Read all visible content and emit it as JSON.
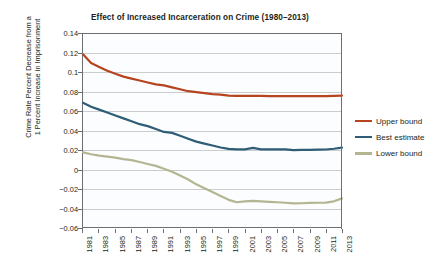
{
  "chart_data": {
    "type": "line",
    "title": "Effect of Increased Incarceration on Crime (1980–2013)",
    "xlabel": "",
    "ylabel": "Crime Rate Percent Decrease from a 1 Percent Increase in Imprisonment",
    "ylabel_lines": [
      "Crime Rate Percent Decrease from a",
      "1 Percent Increase in Imprisonment"
    ],
    "grid": true,
    "legend_position": "right",
    "xlim": [
      1981,
      2013
    ],
    "ylim": [
      -0.06,
      0.14
    ],
    "ytick_labels": [
      "0.14",
      "0.12",
      "0.1",
      "0.08",
      "0.06",
      "0.04",
      "0.02",
      "0",
      "−0.02",
      "−0.04",
      "−0.06"
    ],
    "yticks": [
      0.14,
      0.12,
      0.1,
      0.08,
      0.06,
      0.04,
      0.02,
      0,
      -0.02,
      -0.04,
      -0.06
    ],
    "xtick_labels": [
      "1981",
      "1983",
      "1985",
      "1987",
      "1989",
      "1991",
      "1993",
      "1995",
      "1997",
      "1999",
      "2001",
      "2003",
      "2005",
      "2007",
      "2009",
      "2011",
      "2013"
    ],
    "xticks": [
      1981,
      1983,
      1985,
      1987,
      1989,
      1991,
      1993,
      1995,
      1997,
      1999,
      2001,
      2003,
      2005,
      2007,
      2009,
      2011,
      2013
    ],
    "x": [
      1981,
      1982,
      1983,
      1984,
      1985,
      1986,
      1987,
      1988,
      1989,
      1990,
      1991,
      1992,
      1993,
      1994,
      1995,
      1996,
      1997,
      1998,
      1999,
      2000,
      2001,
      2002,
      2003,
      2004,
      2005,
      2006,
      2007,
      2008,
      2009,
      2010,
      2011,
      2012,
      2013
    ],
    "series": [
      {
        "name": "Upper bound",
        "color": "#b5441f",
        "values": [
          0.118,
          0.109,
          0.105,
          0.101,
          0.098,
          0.095,
          0.093,
          0.091,
          0.089,
          0.087,
          0.086,
          0.084,
          0.082,
          0.08,
          0.079,
          0.078,
          0.077,
          0.0765,
          0.0755,
          0.0752,
          0.0751,
          0.0751,
          0.0751,
          0.075,
          0.075,
          0.075,
          0.0749,
          0.0749,
          0.075,
          0.075,
          0.075,
          0.0752,
          0.0755
        ]
      },
      {
        "name": "Best estimate",
        "color": "#2f5d76",
        "values": [
          0.068,
          0.064,
          0.061,
          0.058,
          0.055,
          0.052,
          0.049,
          0.046,
          0.044,
          0.041,
          0.038,
          0.037,
          0.034,
          0.031,
          0.028,
          0.026,
          0.024,
          0.022,
          0.0205,
          0.02,
          0.02,
          0.0215,
          0.02,
          0.02,
          0.02,
          0.02,
          0.0193,
          0.0195,
          0.0196,
          0.0197,
          0.0199,
          0.0207,
          0.0218
        ]
      },
      {
        "name": "Lower bound",
        "color": "#b4b692",
        "values": [
          0.017,
          0.015,
          0.0135,
          0.0125,
          0.0115,
          0.01,
          0.009,
          0.007,
          0.005,
          0.003,
          0.0,
          -0.003,
          -0.007,
          -0.011,
          -0.016,
          -0.02,
          -0.024,
          -0.028,
          -0.032,
          -0.0345,
          -0.0335,
          -0.033,
          -0.0335,
          -0.034,
          -0.0345,
          -0.035,
          -0.0357,
          -0.0355,
          -0.0352,
          -0.035,
          -0.0348,
          -0.0335,
          -0.0305
        ]
      }
    ]
  },
  "legend": {
    "items": [
      {
        "label": "Upper bound",
        "color": "#b5441f"
      },
      {
        "label": "Best estimate",
        "color": "#2f5d76"
      },
      {
        "label": "Lower bound",
        "color": "#b4b692"
      }
    ]
  }
}
